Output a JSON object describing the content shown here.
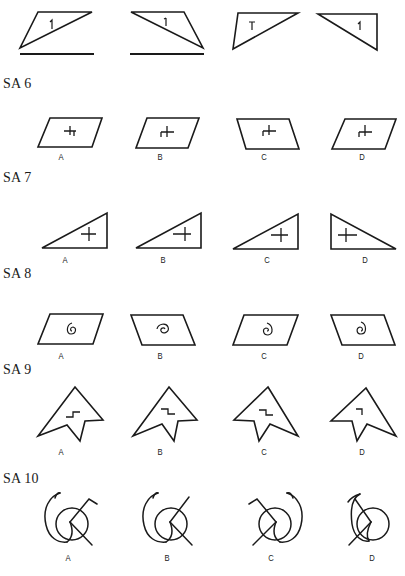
{
  "page": {
    "type": "spatial-ability-test-sheet",
    "background": "#ffffff",
    "ink_color": "#1a1a1a"
  },
  "example": {
    "figures": [
      {
        "id": "ex1",
        "shape": "trapezoid-split-by-diagonal",
        "glyph": "1",
        "underline": true
      },
      {
        "id": "ex2",
        "shape": "trapezoid-split-by-diagonal-mirrored",
        "glyph": "1",
        "underline": true
      },
      {
        "id": "ex3",
        "shape": "obtuse-triangle",
        "glyph": "T",
        "underline": false
      },
      {
        "id": "ex4",
        "shape": "right-triangle",
        "glyph": "1",
        "underline": false
      }
    ]
  },
  "sections": [
    {
      "title": "SA 6",
      "shape": "parallelogram",
      "options": [
        {
          "label": "A",
          "variant": "parallelogram-with-cross-mark-hooked-right"
        },
        {
          "label": "B",
          "variant": "parallelogram-with-cross-mark-hooked-left"
        },
        {
          "label": "C",
          "variant": "reversed-parallelogram-with-cross-mark"
        },
        {
          "label": "D",
          "variant": "parallelogram-with-cross-mark"
        }
      ]
    },
    {
      "title": "SA 7",
      "shape": "right-triangle",
      "options": [
        {
          "label": "A",
          "variant": "right-triangle-with-plus"
        },
        {
          "label": "B",
          "variant": "right-triangle-with-plus-long-arm"
        },
        {
          "label": "C",
          "variant": "right-triangle-with-plus"
        },
        {
          "label": "D",
          "variant": "mirrored-right-triangle-with-plus"
        }
      ]
    },
    {
      "title": "SA 8",
      "shape": "parallelogram",
      "options": [
        {
          "label": "A",
          "variant": "parallelogram-with-spiral"
        },
        {
          "label": "B",
          "variant": "reversed-parallelogram-with-spiral"
        },
        {
          "label": "C",
          "variant": "parallelogram-with-reversed-spiral"
        },
        {
          "label": "D",
          "variant": "reversed-parallelogram-with-spiral"
        }
      ]
    },
    {
      "title": "SA 9",
      "shape": "arrowhead",
      "options": [
        {
          "label": "A",
          "variant": "arrowhead-with-step-up"
        },
        {
          "label": "B",
          "variant": "arrowhead-with-step-down"
        },
        {
          "label": "C",
          "variant": "mirrored-arrowhead-with-step-down"
        },
        {
          "label": "D",
          "variant": "mirrored-arrowhead-with-corner"
        }
      ]
    },
    {
      "title": "SA 10",
      "shape": "circle-with-hook-and-line",
      "options": [
        {
          "label": "A",
          "variant": "circle-hook-left-line-with-flag"
        },
        {
          "label": "B",
          "variant": "circle-hook-left-line"
        },
        {
          "label": "C",
          "variant": "mirrored-circle-hook-right-line-with-flag"
        },
        {
          "label": "D",
          "variant": "circle-hook-left-crossing"
        }
      ]
    }
  ]
}
